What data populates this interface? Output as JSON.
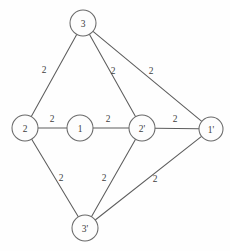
{
  "diagram": {
    "background_color": "#fefefe",
    "edge_color": "#5d5d5d",
    "node_fill": "#fdfdfd",
    "node_stroke": "#6a6a6a",
    "text_color": "#3c3c3c"
  },
  "chart_data": {
    "type": "diagram",
    "title": "",
    "nodes": [
      {
        "id": "3",
        "label": "3",
        "x": 83,
        "y": 23,
        "r": 13
      },
      {
        "id": "2",
        "label": "2",
        "x": 25,
        "y": 128,
        "r": 13
      },
      {
        "id": "1",
        "label": "1",
        "x": 80,
        "y": 128,
        "r": 13
      },
      {
        "id": "2p",
        "label": "2'",
        "x": 142,
        "y": 128,
        "r": 13
      },
      {
        "id": "1p",
        "label": "1'",
        "x": 211,
        "y": 129,
        "r": 12
      },
      {
        "id": "3p",
        "label": "3'",
        "x": 85,
        "y": 228,
        "r": 13
      }
    ],
    "edges": [
      {
        "from": "3",
        "to": "2",
        "weight": "2",
        "label_x": 44,
        "label_y": 70
      },
      {
        "from": "3",
        "to": "2p",
        "weight": "2",
        "label_x": 113,
        "label_y": 71
      },
      {
        "from": "3",
        "to": "1p",
        "weight": "2",
        "label_x": 151,
        "label_y": 71
      },
      {
        "from": "2",
        "to": "1",
        "weight": "2",
        "label_x": 52,
        "label_y": 119
      },
      {
        "from": "1",
        "to": "2p",
        "weight": "2",
        "label_x": 108,
        "label_y": 119
      },
      {
        "from": "2p",
        "to": "1p",
        "weight": "2",
        "label_x": 175,
        "label_y": 119
      },
      {
        "from": "2",
        "to": "3p",
        "weight": "2",
        "label_x": 61,
        "label_y": 178
      },
      {
        "from": "2p",
        "to": "3p",
        "weight": "2",
        "label_x": 104,
        "label_y": 178
      },
      {
        "from": "1p",
        "to": "3p",
        "weight": "2",
        "label_x": 155,
        "label_y": 179
      }
    ],
    "node_count": 6,
    "edge_count": 9
  }
}
